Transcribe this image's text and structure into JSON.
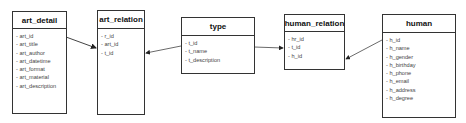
{
  "entities": {
    "art_detail": {
      "title": "art_detail",
      "fields": [
        "art_id",
        "art_title",
        "art_author",
        "art_datetime",
        "art_format",
        "art_material",
        "art_description"
      ]
    },
    "art_relation": {
      "title": "art_relation",
      "fields": [
        "r_id",
        "art_id",
        "t_id"
      ]
    },
    "type": {
      "title": "type",
      "fields": [
        "t_id",
        "t_name",
        "t_description"
      ]
    },
    "human_relation": {
      "title": "human_relation",
      "fields": [
        "hr_id",
        "t_id",
        "h_id"
      ]
    },
    "human": {
      "title": "human",
      "fields": [
        "h_id",
        "h_name",
        "h_gender",
        "h_birthday",
        "h_phone",
        "h_email",
        "h_address",
        "h_degree"
      ]
    }
  },
  "relationships": [
    {
      "from": "art_detail",
      "to": "art_relation"
    },
    {
      "from": "type",
      "to": "art_relation"
    },
    {
      "from": "type",
      "to": "human_relation"
    },
    {
      "from": "human",
      "to": "human_relation"
    }
  ],
  "colors": {
    "line": "#333333",
    "text": "#444444"
  }
}
